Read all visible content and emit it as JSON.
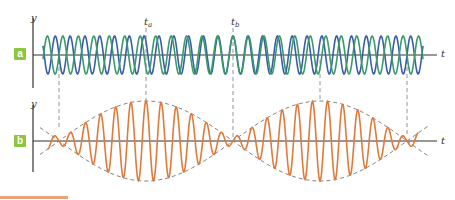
{
  "panels": {
    "a": {
      "badge": "a",
      "y_label": "y",
      "x_label": "t"
    },
    "b": {
      "badge": "b",
      "y_label": "y",
      "x_label": "t"
    }
  },
  "time_markers": {
    "ta": {
      "symbol": "t",
      "subscript": "a"
    },
    "tb": {
      "symbol": "t",
      "subscript": "b"
    }
  },
  "colors": {
    "wave1": "#3a5ea8",
    "wave2": "#3a9a6a",
    "beat": "#e07a3a",
    "envelope": "#777777",
    "axis": "#333333",
    "badge": "#8cc63f"
  },
  "geometry": {
    "panel_a_axis_y": 55,
    "panel_b_axis_y": 141,
    "node_x": [
      59,
      233,
      407
    ],
    "antinode_x": [
      146,
      320
    ],
    "wave_amp": 19,
    "beat_amp": 40
  }
}
